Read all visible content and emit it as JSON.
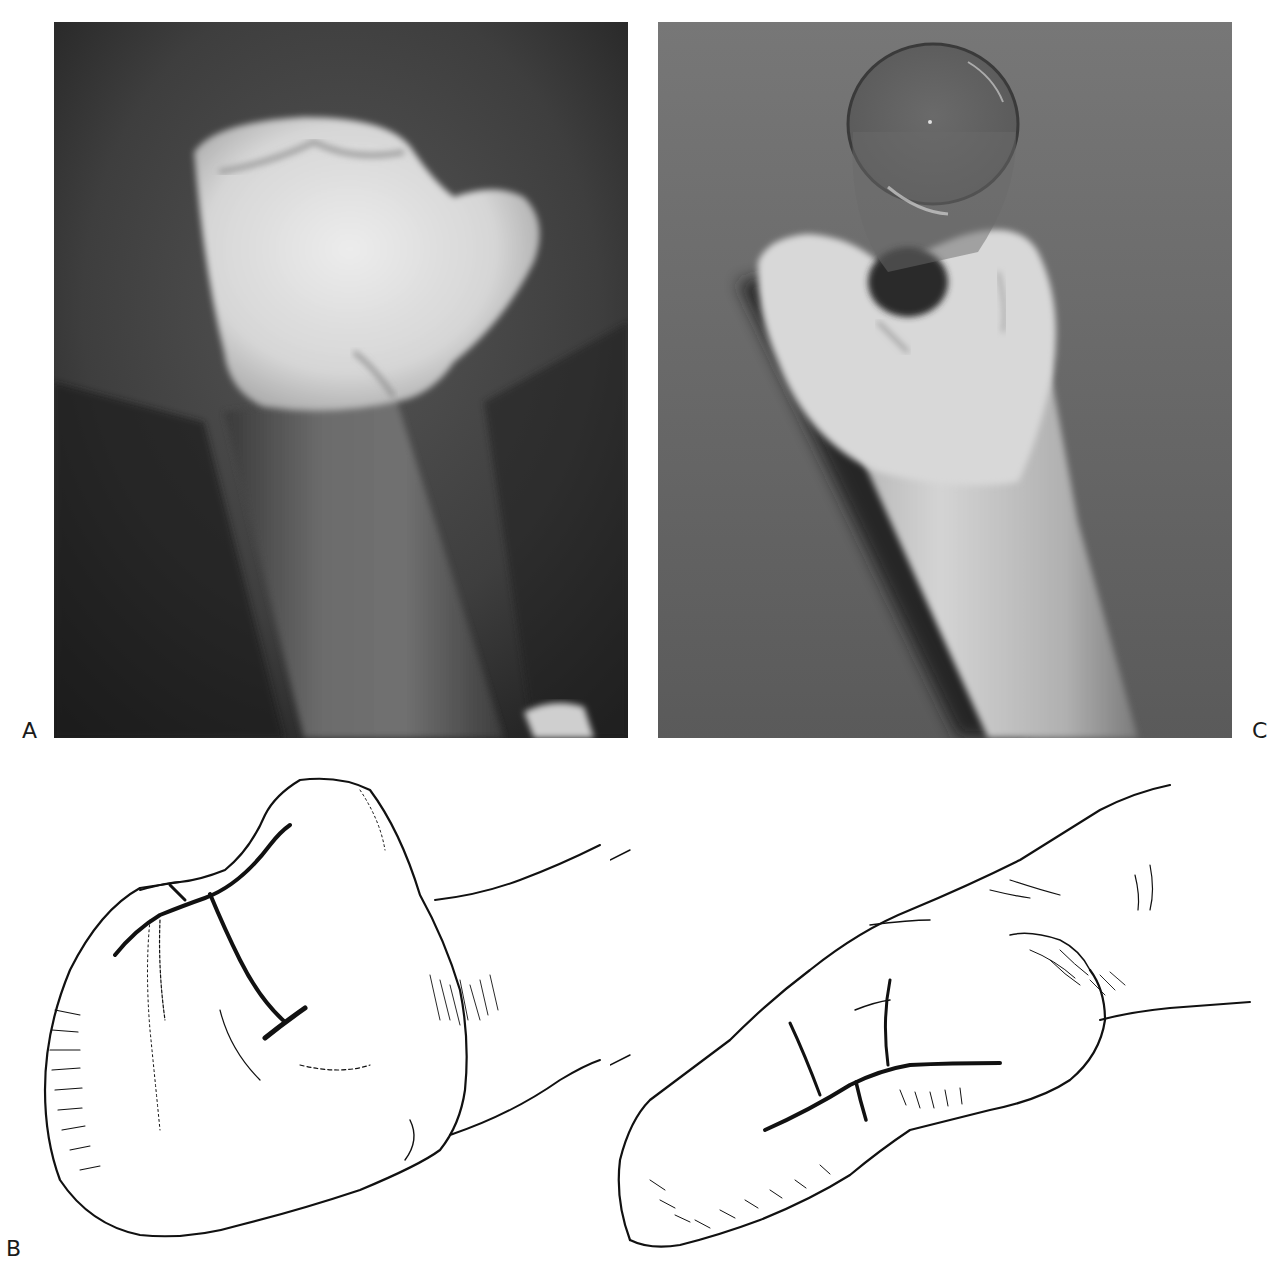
{
  "figure": {
    "panels": [
      {
        "id": "A",
        "label": "A",
        "type": "photograph",
        "description": "Clinical photograph of a malformed hand (mitten-like, thumb projecting to the right) on forearm against dark background"
      },
      {
        "id": "B",
        "label": "B",
        "type": "line-drawing",
        "description": "Two line drawings of the hand showing planned incision lines (T-shaped and H-shaped)"
      },
      {
        "id": "C",
        "label": "C",
        "type": "photograph",
        "description": "Postoperative photograph of hand grasping a clear glass cylinder against grey textured background"
      }
    ],
    "colors": {
      "background": "#ffffff",
      "photo_a_background": "#3c3c3c",
      "photo_c_background": "#6e6e6e",
      "skin_highlight": "#e6e6e6",
      "ink": "#111111"
    }
  }
}
